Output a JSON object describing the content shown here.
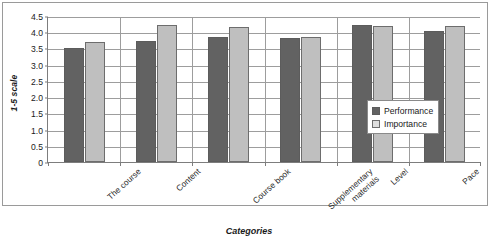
{
  "chart_data": {
    "type": "bar",
    "title": "",
    "xlabel": "Categories",
    "ylabel": "1-5 scale",
    "categories": [
      "The course",
      "Content",
      "Course book",
      "Supplementary materials",
      "Level",
      "Pace"
    ],
    "category_lines": [
      [
        "The course"
      ],
      [
        "Content"
      ],
      [
        "Course book"
      ],
      [
        "Supplementary",
        "materials"
      ],
      [
        "Level"
      ],
      [
        "Pace"
      ]
    ],
    "series": [
      {
        "name": "Performance",
        "color": "#626262",
        "values": [
          3.5,
          3.72,
          3.85,
          3.82,
          4.22,
          4.05
        ]
      },
      {
        "name": "Importance",
        "color": "#bfbfbf",
        "values": [
          3.7,
          4.22,
          4.15,
          3.85,
          4.2,
          4.2
        ]
      }
    ],
    "ylim": [
      0,
      4.5
    ],
    "ytick_values": [
      0,
      0.5,
      1.0,
      1.5,
      2.0,
      2.5,
      3.0,
      3.5,
      4.0,
      4.5
    ],
    "ytick_labels": [
      "0",
      "0.5",
      "1.0",
      "1.5",
      "2.0",
      "2.5",
      "3.0",
      "3.5",
      "4.0",
      "4.5"
    ],
    "grid": true,
    "legend_position": "right-inside",
    "legend_entries": [
      "Performance",
      "Importance"
    ]
  }
}
